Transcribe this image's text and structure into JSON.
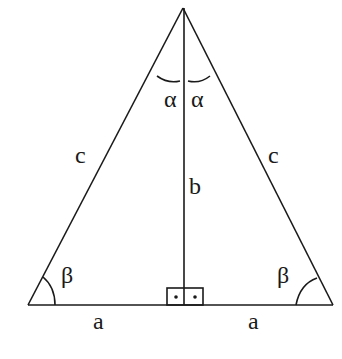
{
  "diagram": {
    "labels": {
      "left_side": "c",
      "right_side": "c",
      "altitude": "b",
      "left_base": "a",
      "right_base": "a",
      "left_apex_angle": "α",
      "right_apex_angle": "α",
      "left_base_angle": "β",
      "right_base_angle": "β"
    },
    "right_angle_marker": "two dots (right angle)",
    "colors": {
      "stroke": "#1a1a1a",
      "background": "#ffffff"
    }
  }
}
